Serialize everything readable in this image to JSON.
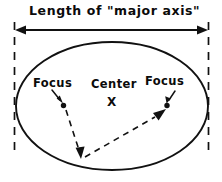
{
  "figure": {
    "kind": "hand-drawn-geometry-diagram",
    "width": 222,
    "height": 182,
    "background_color": "#ffffff",
    "ink_color": "#111111"
  },
  "labels": {
    "title": "Length of \"major axis\"",
    "focus_left": "Focus",
    "focus_right": "Focus",
    "center": "Center",
    "center_mark": "X"
  },
  "geometry": {
    "ellipse": {
      "cx": 112,
      "cy": 106,
      "rx": 96,
      "ry": 64
    },
    "focus_left_point": {
      "x": 63,
      "y": 105
    },
    "focus_right_point": {
      "x": 167,
      "y": 105
    },
    "ellipse_bottom_point": {
      "x": 81,
      "y": 158
    },
    "measure_arrow_y": 30,
    "measure_arrow_x_start": 16,
    "measure_arrow_x_end": 207,
    "extension_line_left_x": 14,
    "extension_line_right_x": 209,
    "extension_line_top_y": 22,
    "extension_line_bottom_y": 152
  },
  "strokes": {
    "solid_label": "solid",
    "dashed_label": "dashed",
    "arrow_label": "arrowhead"
  }
}
